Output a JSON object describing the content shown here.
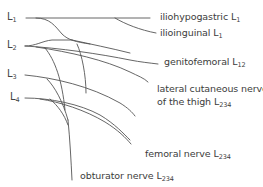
{
  "diagram": {
    "roots": [
      {
        "base": "L",
        "sub": "1"
      },
      {
        "base": "L",
        "sub": "2"
      },
      {
        "base": "L",
        "sub": "3"
      },
      {
        "base": "L",
        "sub": "4"
      }
    ],
    "nerves": [
      {
        "name": "iliohypogastric",
        "base": "L",
        "sub": "1"
      },
      {
        "name": "ilioinguinal",
        "base": "L",
        "sub": "1"
      },
      {
        "name": "genitofemoral",
        "base": "L",
        "sub": "12"
      },
      {
        "name_line1": "lateral cutaneous nerve",
        "name_line2": "of the thigh",
        "base": "L",
        "sub": "234"
      },
      {
        "name": "femoral nerve",
        "base": "L",
        "sub": "234"
      },
      {
        "name": "obturator nerve",
        "base": "L",
        "sub": "234"
      }
    ],
    "line_color": "#555555",
    "text_color": "#3c3c3c"
  }
}
